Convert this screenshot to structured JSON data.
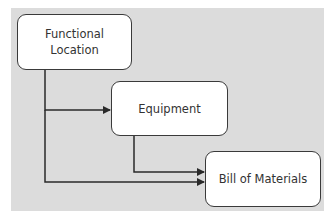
{
  "diagram": {
    "background_color": "#dcdcdc",
    "line_color": "#2a2a2a",
    "nodes": [
      {
        "id": "functional-location",
        "label_line1": "Functional",
        "label_line2": "Location"
      },
      {
        "id": "equipment",
        "label": "Equipment"
      },
      {
        "id": "bill-of-materials",
        "label": "Bill of Materials"
      }
    ],
    "edges": [
      {
        "from": "functional-location",
        "to": "equipment"
      },
      {
        "from": "functional-location",
        "to": "bill-of-materials"
      },
      {
        "from": "equipment",
        "to": "bill-of-materials"
      }
    ]
  }
}
